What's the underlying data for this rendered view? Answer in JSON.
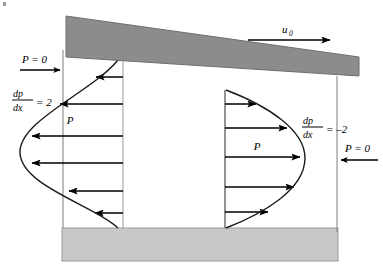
{
  "figure": {
    "name": "slider-bearing-velocity-profiles",
    "background_color": "#ffffff"
  },
  "colors": {
    "slider_fill": "#8c8c8c",
    "slider_stroke": "#6e6e6e",
    "floor_fill": "#c8c8c8",
    "floor_stroke": "#9b9b9b",
    "line": "#000000",
    "boundary_line": "#888888",
    "curve": "#1a1a1a"
  },
  "labels": {
    "u0": {
      "base": "u",
      "subscript": "0",
      "name": "slider-velocity-label"
    },
    "pressure_left": {
      "text": "P = 0",
      "name": "left-pressure-label"
    },
    "pressure_right": {
      "text": "P = 0",
      "name": "right-pressure-label"
    },
    "gradient_left": {
      "numerator": "dp",
      "denominator": "dx",
      "equals": "= 2",
      "value": 2,
      "name": "left-pressure-gradient-label"
    },
    "gradient_right": {
      "numerator": "dp",
      "denominator": "dx",
      "equals": "= –2",
      "value": -2,
      "name": "right-pressure-gradient-label"
    },
    "profile_left_p": {
      "text": "P",
      "name": "left-profile-p-label"
    },
    "profile_right_p": {
      "text": "P",
      "name": "right-profile-p-label"
    }
  },
  "geometry": {
    "slider": {
      "points": "66,16 359,57 359,76 66,57",
      "description": "tilted moving upper plate"
    },
    "floor": {
      "x": 62,
      "y": 228,
      "width": 276,
      "height": 33,
      "description": "stationary lower wall"
    },
    "left_boundary": {
      "x": 63,
      "y1": 50,
      "y2": 228
    },
    "right_boundary": {
      "x": 337,
      "y1": 76,
      "y2": 232
    },
    "left_profile": {
      "baseline_x": 123,
      "top_y": 60,
      "bottom_y": 228,
      "curve": "M118,60 C92,92 20,120 20,152 C20,186 96,206 118,228",
      "arrow_count": 6,
      "direction": "left"
    },
    "right_profile": {
      "baseline_x": 225,
      "top_y": 90,
      "bottom_y": 228,
      "curve": "M226,90 C268,106 305,130 305,158 C305,190 262,214 226,228",
      "arrow_count": 5,
      "direction": "right"
    }
  },
  "arrows": {
    "u0_arrow": {
      "x1": 248,
      "x2": 330,
      "y": 40,
      "direction": "right"
    },
    "left_pressure_arrow": {
      "x1": 20,
      "x2": 62,
      "y": 70,
      "direction": "right"
    },
    "right_pressure_arrow": {
      "x1": 378,
      "x2": 339,
      "y": 160,
      "direction": "left"
    },
    "left_profile_arrows": [
      {
        "tail_x": 123,
        "tip_x": 96,
        "y": 77
      },
      {
        "tail_x": 123,
        "tip_x": 60,
        "y": 104
      },
      {
        "tail_x": 123,
        "tip_x": 32,
        "y": 136
      },
      {
        "tail_x": 123,
        "tip_x": 32,
        "y": 163
      },
      {
        "tail_x": 123,
        "tip_x": 69,
        "y": 191
      },
      {
        "tail_x": 123,
        "tip_x": 95,
        "y": 213
      }
    ],
    "right_profile_arrows": [
      {
        "tail_x": 225,
        "tip_x": 256,
        "y": 104
      },
      {
        "tail_x": 225,
        "tip_x": 287,
        "y": 128
      },
      {
        "tail_x": 225,
        "tip_x": 300,
        "y": 157
      },
      {
        "tail_x": 225,
        "tip_x": 294,
        "y": 187
      },
      {
        "tail_x": 225,
        "tip_x": 268,
        "y": 212
      }
    ]
  }
}
